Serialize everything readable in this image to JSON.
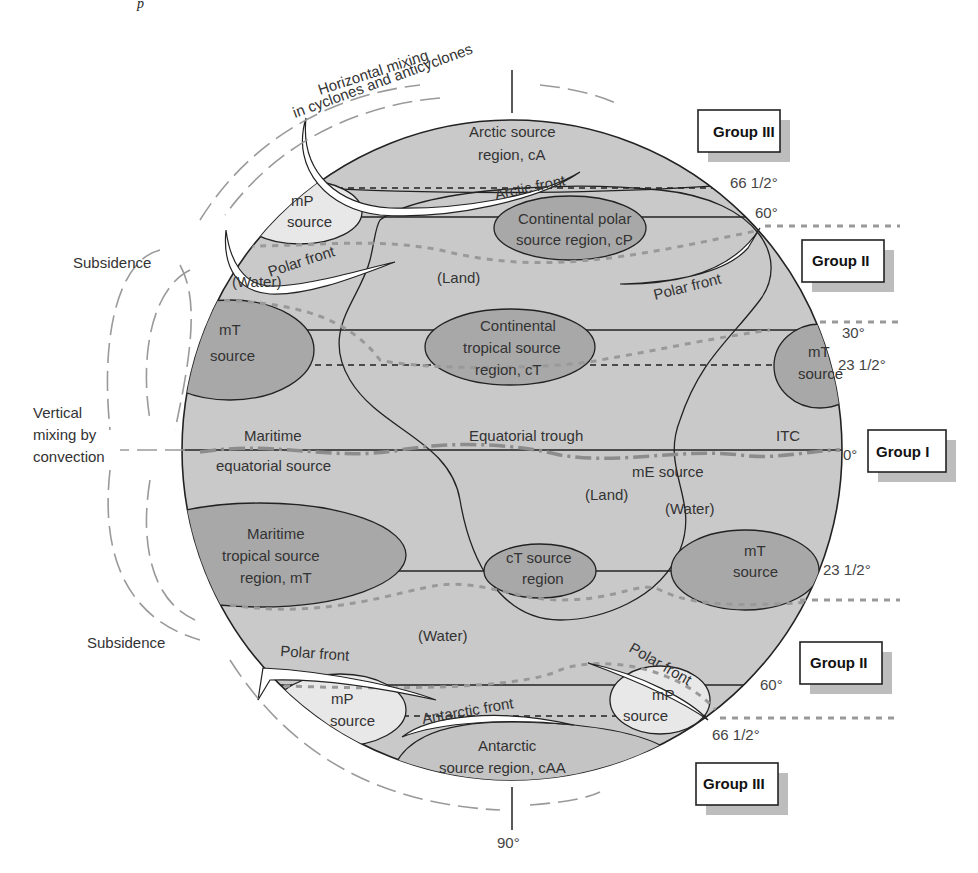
{
  "figure": {
    "caption_fragment": "p",
    "annotations": {
      "horizontal_mixing_line1": "Horizontal mixing",
      "horizontal_mixing_line2": "in cyclones and anticyclones",
      "subsidence_top": "Subsidence",
      "vertical_mixing_line1": "Vertical",
      "vertical_mixing_line2": "mixing by",
      "vertical_mixing_line3": "convection",
      "subsidence_bottom": "Subsidence"
    },
    "latitudes": {
      "lat_66_n": "66 1/2°",
      "lat_60_n": "60°",
      "lat_30_n": "30°",
      "lat_23_n": "23 1/2°",
      "lat_0": "0°",
      "lat_23_s": "23 1/2°",
      "lat_60_s": "60°",
      "lat_66_s": "66 1/2°",
      "lat_90_s": "90°"
    },
    "groups": {
      "group_iii_top": "Group III",
      "group_ii_top": "Group II",
      "group_i": "Group I",
      "group_ii_bottom": "Group II",
      "group_iii_bottom": "Group III"
    },
    "regions": {
      "arctic_line1": "Arctic source",
      "arctic_line2": "region, cA",
      "mp_nw_line1": "mP",
      "mp_nw_line2": "source",
      "cp_line1": "Continental polar",
      "cp_line2": "source region, cP",
      "mt_nw_line1": "mT",
      "mt_nw_line2": "source",
      "ct_line1": "Continental",
      "ct_line2": "tropical source",
      "ct_line3": "region, cT",
      "mt_ne_line1": "mT",
      "mt_ne_line2": "source",
      "me_west_line1": "Maritime",
      "me_west_line2": "equatorial source",
      "me_east": "mE source",
      "mt_sw_line1": "Maritime",
      "mt_sw_line2": "tropical source",
      "mt_sw_line3": "region, mT",
      "ct_s_line1": "cT source",
      "ct_s_line2": "region",
      "mt_se_line1": "mT",
      "mt_se_line2": "source",
      "mp_sw_line1": "mP",
      "mp_sw_line2": "source",
      "mp_se_line1": "mP",
      "mp_se_line2": "source",
      "antarctic_line1": "Antarctic",
      "antarctic_line2": "source region, cAA"
    },
    "surface_labels": {
      "water_n": "(Water)",
      "land_n": "(Land)",
      "land_s": "(Land)",
      "water_se": "(Water)",
      "water_s": "(Water)"
    },
    "fronts": {
      "arctic_front": "Arctic front",
      "polar_front_nw": "Polar front",
      "polar_front_ne": "Polar front",
      "equatorial_trough": "Equatorial trough",
      "itc": "ITC",
      "polar_front_sw": "Polar front",
      "polar_front_se": "Polar front",
      "antarctic_front": "Antarctic front"
    },
    "colors": {
      "globe_fill": "#c9c9c9",
      "source_dark": "#a8a8a8",
      "source_light": "#e8e8e8",
      "arrow_gray": "#9a9a9a",
      "group_shadow": "#bdbdbd"
    }
  }
}
